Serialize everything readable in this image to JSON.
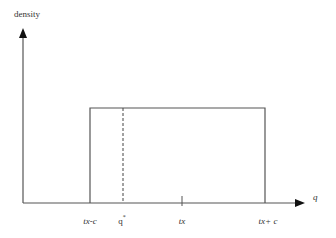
{
  "diagram": {
    "type": "uniform-density",
    "y_axis_label": "density",
    "x_axis_label": "q",
    "tick_labels": {
      "left_bound": "tx-c",
      "q_star_base": "q",
      "q_star_sup": "*",
      "center": "tx",
      "right_bound": "tx+ c"
    },
    "colors": {
      "line": "#555555",
      "text": "#333333",
      "background": "#ffffff"
    }
  }
}
